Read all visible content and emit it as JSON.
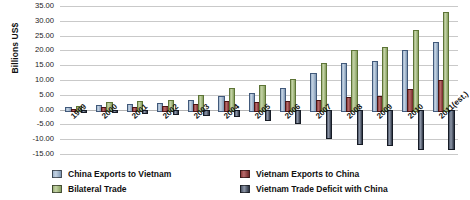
{
  "chart_data": {
    "type": "bar",
    "title": "",
    "xlabel": "",
    "ylabel": "Billions US$",
    "ylim": [
      -15.0,
      35.0
    ],
    "ytick_step": 5.0,
    "ytick_labels": [
      "35.00",
      "30.00",
      "25.00",
      "20.00",
      "15.00",
      "10.00",
      "5.00",
      "0.00",
      "-5.00",
      "-10.00",
      "-15.00"
    ],
    "grid": "horizontal",
    "legend_position": "bottom",
    "categories": [
      "1999",
      "2000",
      "2001",
      "2002",
      "2003",
      "2004",
      "2005",
      "2006",
      "2007",
      "2008",
      "2009",
      "2010",
      "2011(est.)"
    ],
    "series": [
      {
        "name": "China Exports to Vietnam",
        "color": "#9fb4cc",
        "values": [
          0.75,
          1.54,
          1.8,
          2.15,
          3.18,
          4.6,
          5.65,
          7.39,
          12.5,
          15.65,
          16.4,
          20.0,
          23.0
        ]
      },
      {
        "name": "Vietnam Exports to China",
        "color": "#8d3b3b",
        "values": [
          0.35,
          0.93,
          1.02,
          1.12,
          1.75,
          2.74,
          2.55,
          3.03,
          3.36,
          4.35,
          4.75,
          6.9,
          9.9
        ]
      },
      {
        "name": "Bilateral Trade",
        "color": "#9cb07a",
        "values": [
          1.1,
          2.47,
          2.82,
          3.27,
          4.93,
          7.34,
          8.2,
          10.42,
          15.86,
          20.0,
          21.15,
          26.9,
          32.9
        ]
      },
      {
        "name": "Vietnam Trade Deficit with China",
        "color": "#4a5366",
        "values": [
          -0.4,
          -0.61,
          -0.78,
          -1.03,
          -1.43,
          -1.86,
          -3.1,
          -4.36,
          -9.14,
          -11.3,
          -11.65,
          -13.1,
          -13.1
        ]
      }
    ]
  },
  "legend": {
    "items": [
      {
        "label": "China Exports to Vietnam",
        "color": "#9fb4cc",
        "key": "china"
      },
      {
        "label": "Vietnam Exports to China",
        "color": "#8d3b3b",
        "key": "vietnam"
      },
      {
        "label": "Bilateral Trade",
        "color": "#9cb07a",
        "key": "bilat"
      },
      {
        "label": "Vietnam Trade Deficit with China",
        "color": "#4a5366",
        "key": "deficit"
      }
    ]
  }
}
